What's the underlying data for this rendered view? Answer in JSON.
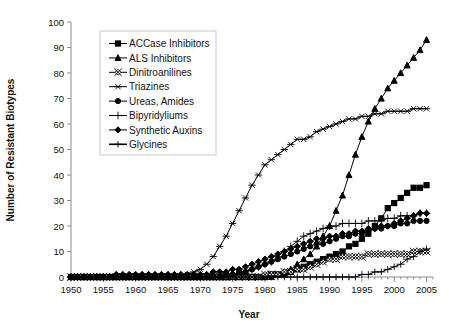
{
  "chart_data": {
    "type": "line",
    "title": "",
    "xlabel": "Year",
    "ylabel": "Number of Resistant Biotypes",
    "xlim": [
      1950,
      2006
    ],
    "ylim": [
      0,
      100
    ],
    "ytick_step": 10,
    "xtick_step": 5,
    "xtick_minor_step": 1,
    "grid": false,
    "legend_position": "upper-left-inside",
    "xticks": [
      1950,
      1955,
      1960,
      1965,
      1970,
      1975,
      1980,
      1985,
      1990,
      1995,
      2000,
      2005
    ],
    "yticks": [
      0,
      10,
      20,
      30,
      40,
      50,
      60,
      70,
      80,
      90,
      100
    ],
    "x": [
      1950,
      1951,
      1952,
      1953,
      1954,
      1955,
      1956,
      1957,
      1958,
      1959,
      1960,
      1961,
      1962,
      1963,
      1964,
      1965,
      1966,
      1967,
      1968,
      1969,
      1970,
      1971,
      1972,
      1973,
      1974,
      1975,
      1976,
      1977,
      1978,
      1979,
      1980,
      1981,
      1982,
      1983,
      1984,
      1985,
      1986,
      1987,
      1988,
      1989,
      1990,
      1991,
      1992,
      1993,
      1994,
      1995,
      1996,
      1997,
      1998,
      1999,
      2000,
      2001,
      2002,
      2003,
      2004,
      2005
    ],
    "series": [
      {
        "name": "ACCase Inhibitors",
        "marker": "filled-square",
        "values": [
          0,
          0,
          0,
          0,
          0,
          0,
          0,
          0,
          0,
          0,
          0,
          0,
          0,
          0,
          0,
          0,
          0,
          0,
          0,
          0,
          0,
          0,
          0,
          0,
          0,
          0,
          0,
          0,
          0,
          0,
          0,
          1,
          1,
          1,
          2,
          3,
          4,
          5,
          6,
          7,
          8,
          9,
          10,
          12,
          13,
          15,
          17,
          20,
          23,
          27,
          29,
          31,
          33,
          35,
          35,
          36
        ]
      },
      {
        "name": "ALS Inhibitors",
        "marker": "filled-triangle",
        "values": [
          0,
          0,
          0,
          0,
          0,
          0,
          0,
          0,
          0,
          0,
          0,
          0,
          0,
          0,
          0,
          0,
          0,
          0,
          0,
          0,
          0,
          0,
          0,
          0,
          0,
          0,
          0,
          0,
          0,
          0,
          0,
          0,
          1,
          2,
          3,
          5,
          7,
          9,
          12,
          16,
          20,
          26,
          32,
          40,
          48,
          55,
          61,
          66,
          70,
          74,
          77,
          80,
          83,
          86,
          89,
          93
        ]
      },
      {
        "name": "Dinitroanilines",
        "marker": "open-diamond-x",
        "values": [
          0,
          0,
          0,
          0,
          0,
          0,
          0,
          0,
          0,
          0,
          0,
          0,
          0,
          0,
          0,
          0,
          0,
          0,
          0,
          0,
          0,
          0,
          0,
          0,
          0,
          0,
          0,
          0,
          0,
          0,
          1,
          1,
          1,
          2,
          2,
          3,
          3,
          4,
          5,
          6,
          7,
          7,
          8,
          8,
          8,
          8,
          9,
          9,
          9,
          9,
          9,
          9,
          9,
          10,
          10,
          10
        ]
      },
      {
        "name": "Triazines",
        "marker": "asterisk",
        "values": [
          0,
          0,
          0,
          0,
          0,
          0,
          0,
          0,
          0,
          0,
          0,
          0,
          0,
          0,
          0,
          0,
          0,
          0,
          1,
          2,
          3,
          5,
          8,
          12,
          16,
          21,
          26,
          31,
          36,
          40,
          44,
          46,
          48,
          50,
          52,
          54,
          54,
          55,
          57,
          58,
          59,
          60,
          61,
          62,
          62,
          63,
          63,
          64,
          64,
          65,
          65,
          65,
          65,
          66,
          66,
          66
        ]
      },
      {
        "name": "Ureas, Amides",
        "marker": "filled-circle",
        "values": [
          0,
          0,
          0,
          0,
          0,
          0,
          0,
          0,
          0,
          0,
          0,
          0,
          0,
          0,
          0,
          0,
          0,
          0,
          0,
          0,
          0,
          0,
          0,
          0,
          1,
          1,
          2,
          2,
          3,
          4,
          5,
          6,
          7,
          8,
          9,
          10,
          11,
          12,
          13,
          13,
          14,
          15,
          16,
          16,
          17,
          17,
          18,
          19,
          19,
          20,
          20,
          21,
          21,
          22,
          22,
          22
        ]
      },
      {
        "name": "Bipyridyliums",
        "marker": "plus",
        "values": [
          0,
          0,
          0,
          0,
          0,
          0,
          0,
          0,
          0,
          0,
          0,
          0,
          0,
          0,
          0,
          0,
          0,
          0,
          0,
          0,
          0,
          0,
          0,
          0,
          0,
          1,
          1,
          2,
          3,
          4,
          5,
          6,
          8,
          10,
          12,
          14,
          16,
          17,
          18,
          19,
          20,
          20,
          21,
          21,
          21,
          21,
          22,
          22,
          22,
          23,
          23,
          24,
          24,
          24,
          25,
          25
        ]
      },
      {
        "name": "Synthetic Auxins",
        "marker": "filled-diamond",
        "values": [
          0,
          0,
          0,
          0,
          0,
          0,
          0,
          1,
          1,
          1,
          1,
          1,
          1,
          1,
          1,
          1,
          1,
          1,
          1,
          1,
          1,
          1,
          2,
          2,
          2,
          3,
          3,
          4,
          5,
          6,
          7,
          8,
          9,
          10,
          11,
          12,
          13,
          14,
          15,
          15,
          16,
          16,
          17,
          17,
          18,
          18,
          19,
          19,
          20,
          20,
          21,
          22,
          23,
          24,
          25,
          25
        ]
      },
      {
        "name": "Glycines",
        "marker": "plus-bold",
        "values": [
          0,
          0,
          0,
          0,
          0,
          0,
          0,
          0,
          0,
          0,
          0,
          0,
          0,
          0,
          0,
          0,
          0,
          0,
          0,
          0,
          0,
          0,
          0,
          0,
          0,
          0,
          0,
          0,
          0,
          0,
          0,
          0,
          0,
          0,
          0,
          0,
          0,
          0,
          0,
          0,
          0,
          0,
          0,
          0,
          0,
          1,
          1,
          2,
          2,
          3,
          4,
          5,
          7,
          8,
          10,
          11
        ]
      }
    ]
  },
  "legend": {
    "items": [
      {
        "label": "ACCase Inhibitors",
        "marker": "filled-square"
      },
      {
        "label": "ALS Inhibitors",
        "marker": "filled-triangle"
      },
      {
        "label": "Dinitroanilines",
        "marker": "open-diamond-x"
      },
      {
        "label": "Triazines",
        "marker": "asterisk"
      },
      {
        "label": "Ureas, Amides",
        "marker": "filled-circle"
      },
      {
        "label": "Bipyridyliums",
        "marker": "plus"
      },
      {
        "label": "Synthetic Auxins",
        "marker": "filled-diamond"
      },
      {
        "label": "Glycines",
        "marker": "plus-bold"
      }
    ]
  },
  "colors": {
    "series_stroke": "#000000",
    "axis": "#8a8a8a",
    "text": "#111111",
    "legend_border": "#c9c9c9",
    "background": "#ffffff"
  }
}
